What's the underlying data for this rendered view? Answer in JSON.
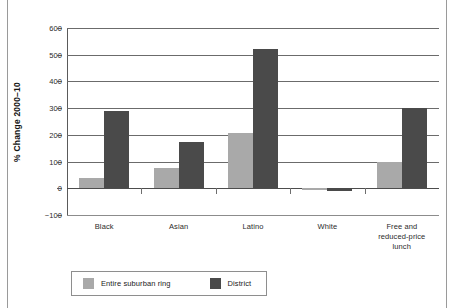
{
  "chart_data": {
    "type": "bar",
    "title": "",
    "subtitle": "",
    "xlabel": "",
    "ylabel": "% Change 2000–10",
    "ylim": [
      -100,
      600
    ],
    "ytick_values": [
      600,
      500,
      400,
      300,
      200,
      100,
      0,
      -100
    ],
    "ytick_labels": [
      "600",
      "500",
      "400",
      "300",
      "200",
      "100",
      "0",
      "−100"
    ],
    "grid": "horizontal",
    "legend_position": "bottom-left",
    "categories": [
      "Black",
      "Asian",
      "Latino",
      "White",
      "Free and reduced-price lunch"
    ],
    "category_label_lines": [
      [
        "Black"
      ],
      [
        "Asian"
      ],
      [
        "Latino"
      ],
      [
        "White"
      ],
      [
        "Free and",
        "reduced-price",
        "lunch"
      ]
    ],
    "series": [
      {
        "name": "Entire suburban ring",
        "color": "#a9a9a9",
        "values": [
          37,
          75,
          207,
          -6,
          100
        ]
      },
      {
        "name": "District",
        "color": "#4a4a4a",
        "values": [
          291,
          175,
          520,
          -10,
          300
        ]
      }
    ]
  },
  "colors": {
    "series_light": "#a9a9a9",
    "series_dark": "#4a4a4a",
    "gridline": "#6b6b6b",
    "axis": "#5a5a5a",
    "text": "#2b2b2b",
    "frame": "#9a9a9a",
    "background": "#ffffff"
  }
}
